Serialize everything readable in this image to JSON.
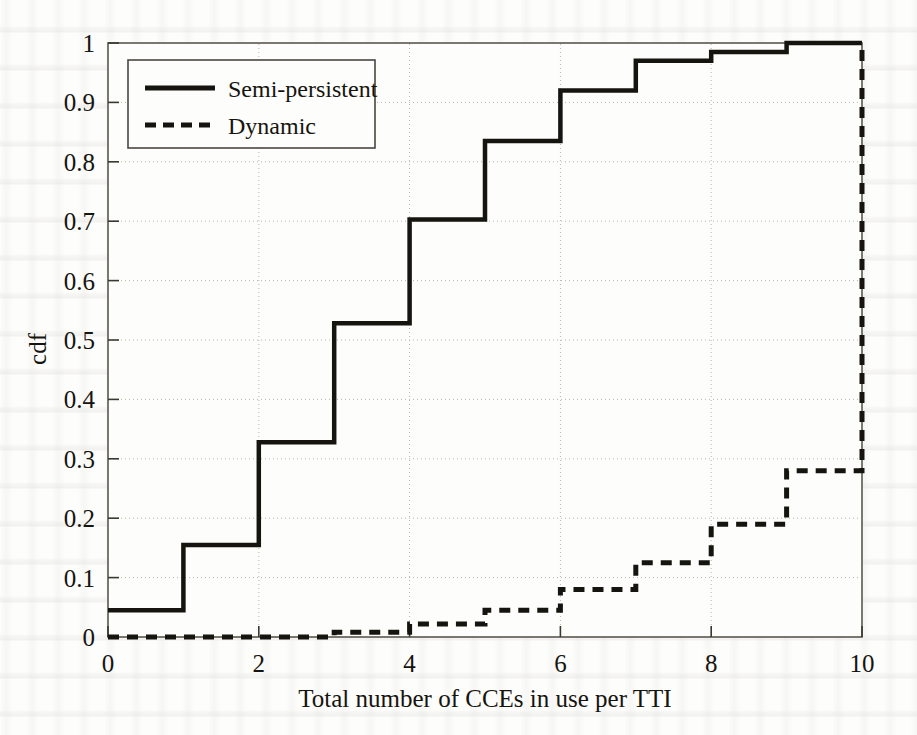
{
  "figure": {
    "kind": "cdf-plot",
    "background_color": "#fdfdfb",
    "ink_color": "#16140f",
    "grid_color": "#b9b6ae",
    "axis_color": "#4a4740"
  },
  "chart_data": {
    "type": "line",
    "title": "",
    "xlabel": "Total number of CCEs in use per TTI",
    "ylabel": "cdf",
    "xlim": [
      0,
      10
    ],
    "ylim": [
      0,
      1
    ],
    "xticks": [
      0,
      2,
      4,
      6,
      8,
      10
    ],
    "xticklabels": [
      "0",
      "2",
      "4",
      "6",
      "8",
      "10"
    ],
    "yticks": [
      0,
      0.1,
      0.2,
      0.3,
      0.4,
      0.5,
      0.6,
      0.7,
      0.8,
      0.9,
      1
    ],
    "yticklabels": [
      "0",
      "0.1",
      "0.2",
      "0.3",
      "0.4",
      "0.5",
      "0.6",
      "0.7",
      "0.8",
      "0.9",
      "1"
    ],
    "grid": true,
    "grid_style": "dotted",
    "legend_position": "upper left",
    "interpolation": "step-post",
    "x": [
      0,
      1,
      2,
      3,
      4,
      5,
      6,
      7,
      8,
      9,
      10
    ],
    "series": [
      {
        "name": "Semi-persistent",
        "style": "solid",
        "color": "#16140f",
        "values": [
          0.045,
          0.155,
          0.328,
          0.528,
          0.703,
          0.835,
          0.92,
          0.97,
          0.985,
          1.0,
          1.0
        ]
      },
      {
        "name": "Dynamic",
        "style": "dashed",
        "color": "#16140f",
        "values": [
          0.0,
          0.0,
          0.0,
          0.008,
          0.022,
          0.045,
          0.08,
          0.125,
          0.19,
          0.28,
          1.0
        ]
      }
    ]
  },
  "legend": {
    "entries": [
      {
        "label": "Semi-persistent",
        "style": "solid"
      },
      {
        "label": "Dynamic",
        "style": "dashed"
      }
    ]
  },
  "axis": {
    "x_title": "Total number of CCEs in use per TTI",
    "y_title": "cdf"
  }
}
